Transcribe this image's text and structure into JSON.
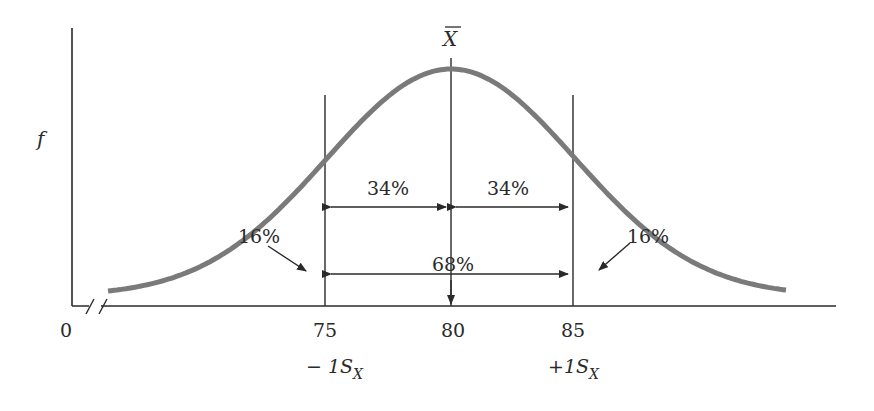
{
  "chart_data": {
    "type": "line",
    "title": "",
    "xlabel": "",
    "ylabel": "f",
    "x_ticks": [
      "0",
      "75",
      "80",
      "85"
    ],
    "x_sub_labels": {
      "75": "-1S_X",
      "85": "+1S_X"
    },
    "mean_label": "X̄",
    "mean": 80,
    "sd": 5,
    "axis_break": true,
    "regions": [
      {
        "label": "16%",
        "range": "< 75"
      },
      {
        "label": "34%",
        "range": "75-80"
      },
      {
        "label": "34%",
        "range": "80-85"
      },
      {
        "label": "16%",
        "range": "> 85"
      },
      {
        "label": "68%",
        "range": "75-85"
      }
    ],
    "curve_color": "#7a7a7a",
    "axis_color": "#2a2a2a"
  },
  "labels": {
    "y_axis": "f",
    "mean_symbol": "X",
    "zero": "0",
    "t75": "75",
    "t80": "80",
    "t85": "85",
    "minus_sd": "− 1S",
    "plus_sd": "+1S",
    "sd_sub": "X",
    "left_pct": "34%",
    "right_pct": "34%",
    "center_pct": "68%",
    "left_tail": "16%",
    "right_tail": "16%"
  }
}
